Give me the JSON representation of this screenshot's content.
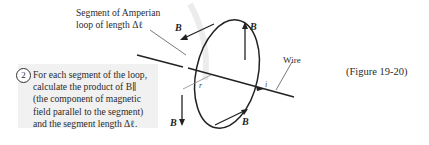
{
  "callout": {
    "line1": "Segment of Amperian",
    "line2": "loop of length Δℓ"
  },
  "step": {
    "number": "2",
    "lines": [
      "For each segment of the loop,",
      "calculate the product of B∥",
      "(the component of magnetic",
      "field parallel to the segment)",
      "and the segment length Δℓ."
    ]
  },
  "diagram": {
    "wire_label": "Wire",
    "current_label": "i",
    "radius_label": "r",
    "field_label": "B⃗"
  },
  "figure_ref": "(Figure 19-20)"
}
